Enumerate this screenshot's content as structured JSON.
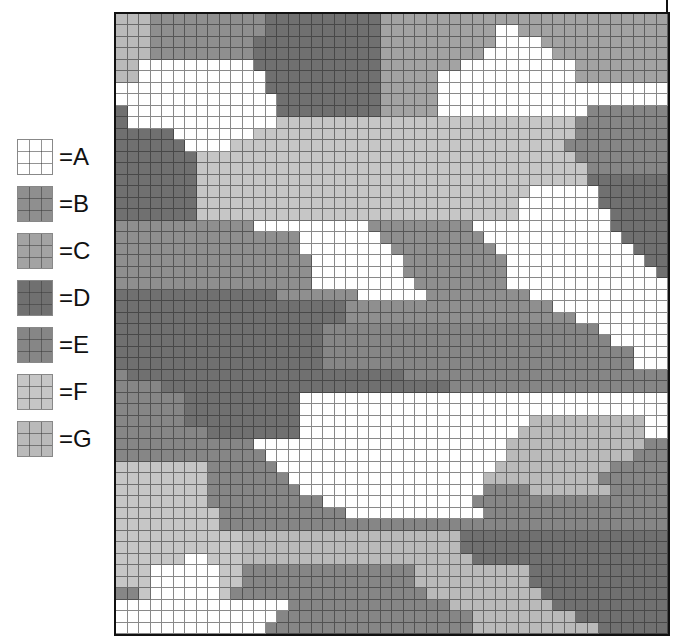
{
  "legend": {
    "items": [
      {
        "key": "A",
        "label": "=A",
        "color": "#ffffff"
      },
      {
        "key": "B",
        "label": "=B",
        "color": "#8f8f8f"
      },
      {
        "key": "C",
        "label": "=C",
        "color": "#a3a3a3"
      },
      {
        "key": "D",
        "label": "=D",
        "color": "#707070"
      },
      {
        "key": "E",
        "label": "=E",
        "color": "#868686"
      },
      {
        "key": "F",
        "label": "=F",
        "color": "#c6c6c6"
      },
      {
        "key": "G",
        "label": "=G",
        "color": "#bababa"
      }
    ]
  },
  "map": {
    "cols": 48,
    "rows": [
      "GGGBBBBBBBBBBDDDDDDDDDDCCCCCCCCCCCCCCCCCCCCCCCCC",
      "GGGBBBBBBBBBBDDDDDDDDDDCCCCCCCCCCAACCCCCCCCCCCCC",
      "GGGBBBBBBBBBDDDDDDDDDDDCCCCCCCCCCAAAACCCCCCCCCCCC",
      "GGGBBBBBBBBBDDDDDDDDDDDCCCCCCCCCAAAAAACCCCCCCCCCC",
      "GGAAAAAAAAAADDDDDDDDDDDCCCCCCCAAAAAAAAAACCCCCCCCC",
      "GGAAAAAAAAAAADDDDDDDDDDCCCCCAAAAAAAAAAAACCCCCCCCC",
      "AAAAAAAAAAAAADDDDDDDDDDCCCCCAAAAAAAAAAAAAAAAAAAAA",
      "AAAAAAAAAAAAAADDDDDDDDDCCCCCAAAAAAAAAAAAAAAAAAAAA",
      "DAAAAAAAAAAAAADDDDDDDDDCCCCCAAAAAAAAAAAAAEEEEEEEE",
      "DAAAAAAAAAAAAAFFFFFFFFFFFFFFFFFFFFFFFFFFEEEEEEEEE",
      "DDDDDAAAAAAAFFFFFFFFFFFFFFFFFFFFFFFFFFFFEEEEEEEEE",
      "DDDDDDAAAAFFFFFFFFFFFFFFFFFFFFFFFFFFFFFEEEEEEEEEE",
      "DDDDDDDFFFFFFFFFFFFFFFFFFFFFFFFFFFFFFFFFEEEEEEEEE",
      "DDDDDDDFFFFFFFFFFFFFFFFFFFFFFFFFFFFFFFFFFEEEEEEEE",
      "DDDDDDDFFFFFFFFFFFFFFFFFFFFFFFFFFFFFFFFFFDDDDDDDD",
      "DDDDDDDFFFFFFFFFFFFFFFFFFFFFFFFFFFFFAAAAAADDDDDDD",
      "DDDDDDDFFFFFFFFFFFFFFFFFFFFFFFFFFFFAAAAAAADDDDDDD",
      "DDDDDDDFFFFFFFFFFFFFFFFFFFFFFFFFFFFAAAAAAAADDDDDD",
      "BBBBBBBBBBBBAAAAAAAAAABBBBBBBBBAAAAAAAAAAAADDDDDD",
      "BBBBBBBBBBBBBBBBAAAAAAABBBBBBBBBAAAAAAAAAAAADDDDD",
      "BBBBBBBBBBBBBBBBAAAAAAAABBBBBBBBBAAAAAAAAAAAADDDD",
      "BBBBBBBBBBBBBBBBBAAAAAAAABBBBBBBBBAAAAAAAAAAAADDD",
      "BBBBBBBBBBBBBBBBBAAAAAAAABBBBBBBBBAAAAAAAAAAAAADD",
      "BBBBBBBBBBBBBBBBBAAAAAAAAABBBBBBBBAAAAAAAAAAAAAAD",
      "DDDDDDDDDDDDDDBBBBBBBAAAAAABBBBBBBBBAAAAAAAAAAAAAD",
      "DDDDDDDDDDDDDDDDDDDDBBBBBBBBBBBBBBBBBBAAAAAAAAAAA",
      "DDDDDDDDDDDDDDDDDDDDBBBBBBBBBBBBBBBBBBBBAAAAAAAAA",
      "DDDDDDDDDDDDDDDDDDEEEEEEEEEEEEEEEEEEEEEEEEAAAAAAA",
      "DDDDDDDDDDDDDDDDDDEEEEEEEEEEEEEEEEEEEEEEEEEAAAAAA",
      "DDDDDDDDDDDDDDDDDDEEEEEEEEEEEEEEEEEEEEEEEEEEEAAAA",
      "DDDDDDDDDDDDDDDDDDEEEEEEEEEEEEEEEEEEEEEEEEEEEAAAA",
      "EDDDDDDDDDDDDDDDDDDDDDDDDEEEEEEEEEEEEEEEEEEEEEEEE",
      "EEEEDDDDDDDDDDDDDDDDDDDDDDDDDEEEEEEEEEEEEEEEEEEEE",
      "EEEEEEDDDDDDDDDDAAAAAAAAAAAAAAAAAAAAAAAAAAAAAAAAA",
      "EEEEEEDDDDDDDDDDAAAAAAAAAAAAAAAAAAAAAAAAAAAAAAAAA",
      "EEEEEEDDDDDDDDDDAAAAAAAAAAAAAAAAAAAAGGGGGGGGGGAAAA",
      "EEEEEEEEDDDDDDDDAAAAAAAAAAAAAAAAAAAGGGGGGGGGGGAAAA",
      "EEEEEEEEEEEEAAAAAAAAAAAAAAAAAAAAAAGGGGGGGGGGGGEEEE",
      "EEEEEEEEEEEEEAAAAAAAAAAAAAAAAAAAAAGGGGGGGGGGGEEEEE",
      "FFFFFFFFEEEEEEAAAAAAAAAAAAAAAAAAAGGGGGGGGGGEEEEEEE",
      "FFFFFFFFEEEEEEEAAAAAAAAAAAAAAAAAGGGGGGGGGGEEEEEEEE",
      "FFFFFFFFEEEEEEEEAAAAAAAAAAAAAAAAEEEEGGGGGGGEEEEEEE",
      "FFFFFFFFEEEEEEEEEEAAAAAAAAAAAAAEEEEEEEEEEEEEEEEEEE",
      "FFFFFFFFFEEEEEEEEEEEAAAAAAAAAAAAEEEEEEEEEEEEEEEEEE",
      "FFFFFFFFFEEEEEEEEEEEEEEEEEEEEEEEEEEEEEEEEEEEEEEEE",
      "FFFFFFFFFFFGGGGGGGGGGGGGGGGGGGDDDDDDDDDDDDDDDDDDD",
      "FFFFFFFFFFFGGGGGGGGGGGGGGGGGGGDDDDDDDDDDDDDDDDDDD",
      "FFFFFFAAFFFGGGGGGGGGGGGGGGGGGGGDDDDDDDDDDDDDDDDDD",
      "FFFAAAAAAFFEEEEEEEEEEEEEEEGGGGGGGGGGDDDDDDDDDDDDD",
      "FFFAAAAAAFFEEEEEEEEEEEEEEEGGGGGGGGGGDDDDDDDDDDDDD",
      "EEFAAAAAAFEEEEEEEEEEEEEEEEEGGGGGGGGGGDDDDDDDDDDDD",
      "AAAAAAAAAAAAAAAEEEEEEEEEEEEEEGGGGGGGGGDDDDDDDDDDD",
      "AAAAAAAAAAAAAAEEEEEEEEEEEEEEEEEGGGGGGGGGDDDDDDDDD",
      "AAAAAAAAAAAAAEEEEEEEEEEEEEEEEEEGGGGGGGGGGGDDDDDDD"
    ]
  }
}
